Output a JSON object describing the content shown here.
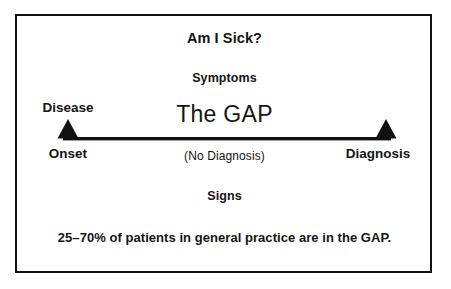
{
  "figure": {
    "heading_question": "Am I Sick?",
    "symptoms_label": "Symptoms",
    "gap_title": "The GAP",
    "no_diagnosis_label": "(No Diagnosis)",
    "signs_label": "Signs",
    "caption": "25–70% of patients in general practice are in the GAP.",
    "axis": {
      "left_top_label": "Disease",
      "left_bottom_label": "Onset",
      "right_bottom_label": "Diagnosis",
      "left_marker_icon": "triangle-up-icon",
      "right_marker_icon": "triangle-up-icon",
      "line_icon": "horizontal-rule-icon"
    },
    "colors": {
      "ink": "#141414",
      "frame": "#111111",
      "background": "#ffffff"
    }
  }
}
